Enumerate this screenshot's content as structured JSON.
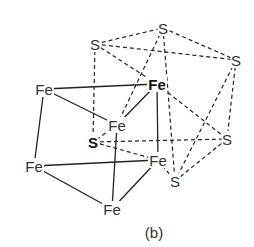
{
  "figure": {
    "caption": "(b)",
    "caption_pos": [
      154,
      238
    ]
  },
  "atoms": [
    {
      "id": "S_top",
      "label": "S",
      "x": 163,
      "y": 28,
      "bold": false
    },
    {
      "id": "S_upleft",
      "label": "S",
      "x": 95,
      "y": 44,
      "bold": false
    },
    {
      "id": "S_right",
      "label": "S",
      "x": 236,
      "y": 60,
      "bold": false
    },
    {
      "id": "Fe_bold",
      "label": "Fe",
      "x": 157,
      "y": 84,
      "bold": true
    },
    {
      "id": "Fe_left",
      "label": "Fe",
      "x": 44,
      "y": 89,
      "bold": false
    },
    {
      "id": "Fe_center",
      "label": "Fe",
      "x": 117,
      "y": 125,
      "bold": false
    },
    {
      "id": "S_bold",
      "label": "S",
      "x": 93,
      "y": 142,
      "bold": true
    },
    {
      "id": "S_rightlow",
      "label": "S",
      "x": 227,
      "y": 139,
      "bold": false
    },
    {
      "id": "Fe_leftlow",
      "label": "Fe",
      "x": 34,
      "y": 166,
      "bold": false
    },
    {
      "id": "Fe_right",
      "label": "Fe",
      "x": 158,
      "y": 160,
      "bold": false
    },
    {
      "id": "S_bottom",
      "label": "S",
      "x": 175,
      "y": 181,
      "bold": false
    },
    {
      "id": "Fe_bottom",
      "label": "Fe",
      "x": 112,
      "y": 209,
      "bold": false
    }
  ],
  "bonds_solid": [
    [
      "Fe_left",
      "Fe_bold"
    ],
    [
      "Fe_left",
      "Fe_center"
    ],
    [
      "Fe_left",
      "Fe_leftlow"
    ],
    [
      "Fe_center",
      "Fe_bold"
    ],
    [
      "Fe_center",
      "Fe_bottom"
    ],
    [
      "Fe_bold",
      "Fe_right"
    ],
    [
      "Fe_leftlow",
      "Fe_right"
    ],
    [
      "Fe_leftlow",
      "Fe_bottom"
    ],
    [
      "Fe_right",
      "Fe_bottom"
    ]
  ],
  "bonds_dashed": [
    [
      "S_upleft",
      "S_top"
    ],
    [
      "S_upleft",
      "S_right"
    ],
    [
      "S_upleft",
      "Fe_bold"
    ],
    [
      "S_upleft",
      "S_bold"
    ],
    [
      "S_top",
      "S_right"
    ],
    [
      "S_top",
      "Fe_center"
    ],
    [
      "S_top",
      "S_bottom"
    ],
    [
      "S_right",
      "S_rightlow"
    ],
    [
      "S_right",
      "S_bottom"
    ],
    [
      "Fe_bold",
      "S_rightlow"
    ],
    [
      "Fe_center",
      "S_bold"
    ],
    [
      "S_bold",
      "S_rightlow"
    ],
    [
      "S_bold",
      "Fe_right"
    ],
    [
      "S_rightlow",
      "S_bottom"
    ],
    [
      "Fe_right",
      "S_bottom"
    ]
  ]
}
